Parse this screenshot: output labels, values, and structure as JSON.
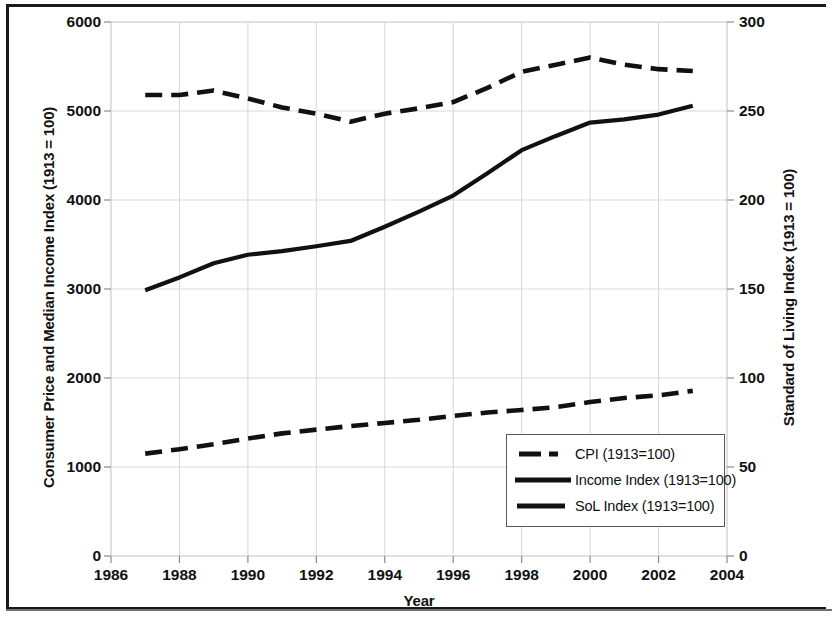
{
  "chart_data": {
    "type": "line",
    "title": "",
    "xlabel": "Year",
    "ylabel": "Consumer Price and Median Income Index (1913 = 100)",
    "y2label": "Standard of Living Index (1913 = 100)",
    "xlim": [
      1986,
      2004
    ],
    "ylim": [
      0,
      6000
    ],
    "y2lim": [
      0,
      300
    ],
    "xticks": [
      1986,
      1988,
      1990,
      1992,
      1994,
      1996,
      1998,
      2000,
      2002,
      2004
    ],
    "yticks": [
      0,
      1000,
      2000,
      3000,
      4000,
      5000,
      6000
    ],
    "y2ticks": [
      0,
      50,
      100,
      150,
      200,
      250,
      300
    ],
    "grid": true,
    "legend_position": "lower-right-inside",
    "x": [
      1987,
      1988,
      1989,
      1990,
      1991,
      1992,
      1993,
      1994,
      1995,
      1996,
      1997,
      1998,
      1999,
      2000,
      2001,
      2002,
      2003
    ],
    "series": [
      {
        "name": "CPI (1913=100)",
        "axis": "left",
        "style": "dashed",
        "color": "#111111",
        "values": [
          1150,
          1200,
          1255,
          1320,
          1378,
          1420,
          1460,
          1495,
          1530,
          1575,
          1612,
          1640,
          1672,
          1730,
          1775,
          1805,
          1855
        ]
      },
      {
        "name": "Income Index (1913=100)",
        "axis": "left",
        "style": "solid",
        "color": "#111111",
        "values": [
          2985,
          3130,
          3290,
          3385,
          3425,
          3480,
          3540,
          3700,
          3870,
          4050,
          4300,
          4560,
          4720,
          4870,
          4905,
          4960,
          5060
        ]
      },
      {
        "name": "SoL Index (1913=100)",
        "axis": "right",
        "style": "dashed",
        "color": "#111111",
        "values": [
          259,
          259,
          261.5,
          257,
          252,
          248.5,
          244,
          248.5,
          251.5,
          255,
          263,
          272,
          276,
          280,
          276,
          273.5,
          272.5
        ]
      }
    ]
  },
  "axes": {
    "left_title": "Consumer Price and Median Income Index (1913 = 100)",
    "right_title": "Standard of Living Index (1913 = 100)",
    "x_title": "Year",
    "left_ticks": [
      "6000",
      "5000",
      "4000",
      "3000",
      "2000",
      "1000",
      "0"
    ],
    "right_ticks": [
      "300",
      "250",
      "200",
      "150",
      "100",
      "50",
      "0"
    ],
    "x_ticks": [
      "1986",
      "1988",
      "1990",
      "1992",
      "1994",
      "1996",
      "1998",
      "2000",
      "2002",
      "2004"
    ]
  },
  "legend": {
    "items": [
      {
        "label": "CPI (1913=100)",
        "style": "dashed"
      },
      {
        "label": "Income Index (1913=100)",
        "style": "solid"
      },
      {
        "label": "SoL Index (1913=100)",
        "style": "solid-short"
      }
    ]
  },
  "colors": {
    "line": "#111111",
    "grid": "#d9d9d9",
    "frame": "#1a1a1a",
    "legend_border": "#595959",
    "background": "#ffffff"
  }
}
